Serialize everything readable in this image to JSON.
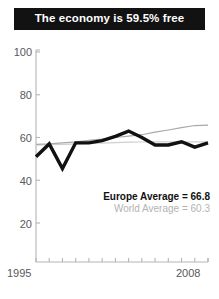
{
  "title": {
    "text": "The economy is 59.5% free",
    "background": "#121212",
    "color": "#ffffff"
  },
  "legend": {
    "europe": "Europe Average = 66.8",
    "world": "World Average = 60.3",
    "europe_color": "#111111",
    "world_color": "#b3b3b3"
  },
  "chart_data": {
    "type": "line",
    "title": "The economy is 59.5% free",
    "xlabel": "",
    "ylabel": "",
    "xlim": [
      1995,
      2008
    ],
    "ylim": [
      0,
      100
    ],
    "yticks": [
      100,
      80,
      60,
      40,
      20
    ],
    "xticks": [
      1995,
      1996,
      1997,
      1998,
      1999,
      2000,
      2001,
      2002,
      2003,
      2004,
      2005,
      2006,
      2007,
      2008
    ],
    "xtick_labels_shown": [
      "1995",
      "2008"
    ],
    "grid": false,
    "legend_position": "inside-lower-right",
    "x": [
      1995,
      1996,
      1997,
      1998,
      1999,
      2000,
      2001,
      2002,
      2003,
      2004,
      2005,
      2006,
      2007,
      2008
    ],
    "series": [
      {
        "name": "Country",
        "color": "#111111",
        "width": 3.4,
        "values": [
          51.0,
          57.0,
          45.5,
          57.5,
          57.5,
          58.5,
          60.5,
          63.0,
          60.0,
          56.5,
          56.5,
          58.0,
          55.5,
          57.5
        ]
      },
      {
        "name": "World Average",
        "color": "#a9a9a9",
        "width": 1.2,
        "values": [
          56.8,
          57.0,
          57.5,
          58.0,
          58.7,
          59.3,
          60.0,
          60.6,
          61.3,
          62.5,
          63.5,
          64.6,
          65.6,
          65.8
        ]
      },
      {
        "name": "Europe Average",
        "color": "#cfcfcf",
        "width": 1.2,
        "values": [
          56.4,
          56.6,
          56.8,
          57.0,
          57.2,
          57.4,
          57.6,
          57.8,
          57.9,
          58.0,
          58.0,
          58.0,
          58.0,
          58.0
        ]
      }
    ],
    "annotations": [
      "Europe Average = 66.8",
      "World Average = 60.3"
    ]
  },
  "axis": {
    "y_ticks": [
      {
        "label": "100",
        "value": 100
      },
      {
        "label": "80",
        "value": 80
      },
      {
        "label": "60",
        "value": 60
      },
      {
        "label": "40",
        "value": 40
      },
      {
        "label": "20",
        "value": 20
      }
    ],
    "x_start_label": "1995",
    "x_end_label": "2008",
    "axis_color": "#b5b5b5"
  }
}
